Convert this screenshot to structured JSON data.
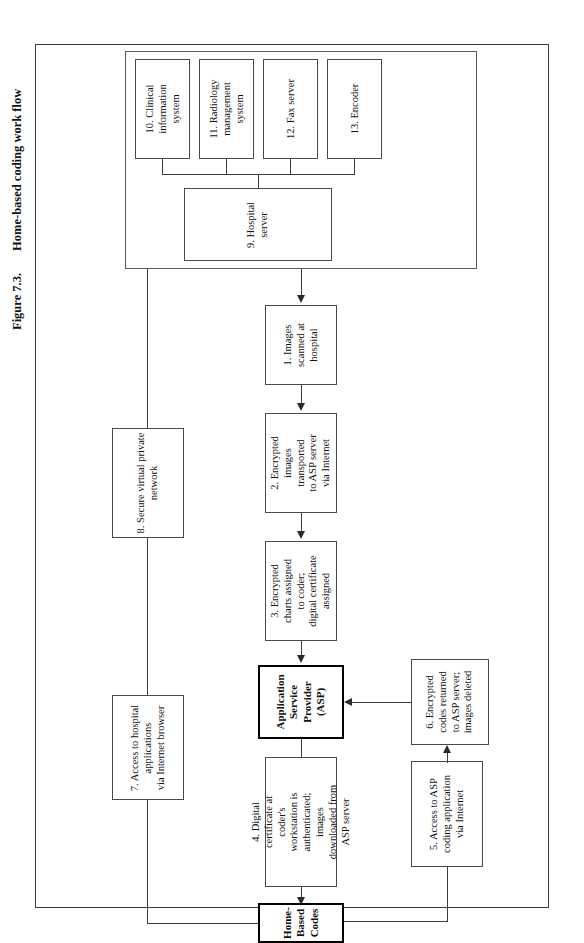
{
  "figure": {
    "number": "Figure 7.3.",
    "title": "Home-based coding work flow"
  },
  "colors": {
    "ink": "#111111",
    "box_border": "#4a4a4a",
    "emphasis_border": "#000000",
    "connector": "#3c3c3c",
    "background": "#ffffff"
  },
  "nodes": {
    "n10": {
      "label": "10. Clinical\ninformation\nsystem",
      "line1": "10. Clinical",
      "line2": "information",
      "line3": "system"
    },
    "n11": {
      "label": "11. Radiology\nmanagement\nsystem",
      "line1": "11. Radiology",
      "line2": "management",
      "line3": "system"
    },
    "n12": {
      "label": "12. Fax server",
      "line1": "12. Fax server"
    },
    "n13": {
      "label": "13. Encoder",
      "line1": "13. Encoder"
    },
    "n9": {
      "label": "9. Hospital\nserver",
      "line1": "9. Hospital",
      "line2": "server"
    },
    "n1": {
      "label": "1. Images\nscanned at\nhospital",
      "line1": "1. Images",
      "line2": "scanned at",
      "line3": "hospital"
    },
    "n2": {
      "label": "2. Encrypted\nimages\ntransported\nto ASP server\nvia Internet",
      "line1": "2. Encrypted",
      "line2": "images",
      "line3": "transported",
      "line4": "to ASP server",
      "line5": "via Internet"
    },
    "n3": {
      "label": "3. Encrypted\ncharts assigned\nto coder;\ndigital certificate\nassigned",
      "line1": "3. Encrypted",
      "line2": "charts assigned",
      "line3": "to coder;",
      "line4": "digital certificate",
      "line5": "assigned"
    },
    "asp": {
      "label": "Application\nService\nProvider\n(ASP)",
      "line1": "Application",
      "line2": "Service",
      "line3": "Provider",
      "line4": "(ASP)"
    },
    "n6": {
      "label": "6. Encrypted\ncodes returned\nto ASP server;\nimages deleted",
      "line1": "6. Encrypted",
      "line2": "codes returned",
      "line3": "to ASP server;",
      "line4": "images deleted"
    },
    "n4": {
      "label": "4. Digital\ncertificate at\ncoder's\nworkstation is\nauthenticated;\nimages\ndownloaded from\nASP server",
      "line1": "4. Digital",
      "line2": "certificate at",
      "line3": "coder's",
      "line4": "workstation is",
      "line5": "authenticated;",
      "line6": "images",
      "line7": "downloaded from",
      "line8": "ASP server"
    },
    "n5": {
      "label": "5. Access to ASP\ncoding application\nvia Internet",
      "line1": "5. Access to ASP",
      "line2": "coding application",
      "line3": "via Internet"
    },
    "n7": {
      "label": "7. Access to hospital\napplications\nvia Internet browser",
      "line1": "7. Access to hospital",
      "line2": "applications",
      "line3": "via Internet browser"
    },
    "n8": {
      "label": "8. Secure virtual private\nnetwork",
      "line1": "8. Secure virtual private",
      "line2": "network"
    },
    "hbc": {
      "label": "Home-\nBased\nCodes",
      "line1": "Home-",
      "line2": "Based",
      "line3": "Codes"
    }
  }
}
